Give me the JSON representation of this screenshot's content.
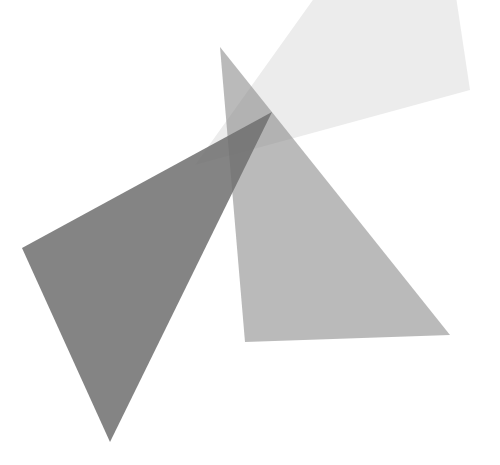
{
  "canvas": {
    "width": 500,
    "height": 465,
    "background": "#ffffff"
  },
  "shapes": [
    {
      "name": "light-triangle",
      "points": "195,165 320,-10 455,-10 470,90",
      "fill": "#dcdcdc",
      "opacity": 0.55
    },
    {
      "name": "medium-triangle",
      "points": "220,47 450,335 245,342",
      "fill": "#8c8c8c",
      "opacity": 0.6
    },
    {
      "name": "dark-triangle",
      "points": "22,248 272,112 110,442",
      "fill": "#6e6e6e",
      "opacity": 0.85
    }
  ]
}
